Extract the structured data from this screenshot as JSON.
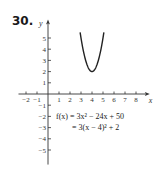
{
  "problem_number": "30.",
  "chart_data": {
    "type": "line",
    "title": "",
    "xlabel": "x",
    "ylabel": "y",
    "xlim": [
      -2.5,
      8.8
    ],
    "ylim": [
      -6.3,
      6.2
    ],
    "x_ticks": [
      -2,
      -1,
      1,
      2,
      3,
      4,
      5,
      6,
      7,
      8
    ],
    "x_tick_labels": [
      "−2",
      "−1",
      "1",
      "2",
      "3",
      "4",
      "5",
      "6",
      "7",
      "8"
    ],
    "y_ticks": [
      5,
      4,
      3,
      2,
      1,
      -1,
      -2,
      -3,
      -4,
      -5
    ],
    "y_tick_labels": [
      "5",
      "4",
      "3",
      "2",
      "1",
      "−1",
      "−2",
      "−3",
      "−4",
      "−5"
    ],
    "grid": false,
    "series": [
      {
        "name": "f(x) = 3x^2 - 24x + 50",
        "function": "3(x-4)^2+2",
        "vertex": [
          4,
          2
        ],
        "x_range": [
          2.92,
          5.08
        ],
        "color": "#222222"
      }
    ],
    "annotations": [
      "f(x) = 3x² − 24x + 50",
      "= 3(x − 4)² + 2"
    ]
  }
}
